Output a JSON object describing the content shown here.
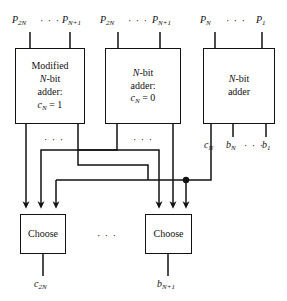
{
  "diagram": {
    "canvas": {
      "width": 287,
      "height": 301
    },
    "colors": {
      "line": "#121212",
      "background": "#ffffff",
      "text": "#101010"
    },
    "ellipsis": "· · ·",
    "top_inputs": [
      {
        "id": "group-1",
        "left": "P2N",
        "right": "PN+1"
      },
      {
        "id": "group-2",
        "left": "P2N",
        "right": "PN+1"
      },
      {
        "id": "group-3",
        "left": "PN",
        "right": "P1"
      }
    ],
    "adders": [
      {
        "id": "modified-adder",
        "lines": [
          "Modified",
          "N-bit",
          "adder:",
          "cN = 1"
        ],
        "x": 15,
        "y": 48,
        "w": 70,
        "h": 76
      },
      {
        "id": "nbit-adder-c0",
        "lines": [
          "N-bit",
          "adder:",
          "cN = 0"
        ],
        "x": 105,
        "y": 48,
        "w": 76,
        "h": 76
      },
      {
        "id": "nbit-adder",
        "lines": [
          "N-bit",
          "adder"
        ],
        "x": 203,
        "y": 48,
        "w": 72,
        "h": 76
      }
    ],
    "adder_outputs": [
      "cN",
      "bN",
      "b1"
    ],
    "choosers": [
      {
        "id": "choose-left",
        "label": "Choose",
        "output": "c2N",
        "x": 20,
        "y": 214,
        "w": 46,
        "h": 40
      },
      {
        "id": "choose-right",
        "label": "Choose",
        "output": "bN+1",
        "x": 145,
        "y": 214,
        "w": 47,
        "h": 40
      }
    ],
    "junction": {
      "x": 186,
      "y": 180,
      "r": 3.2
    }
  }
}
